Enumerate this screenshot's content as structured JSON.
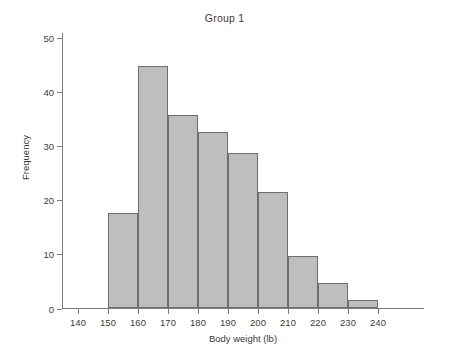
{
  "chart_data": {
    "type": "bar",
    "title": "Group 1",
    "xlabel": "Body weight (lb)",
    "ylabel": "Frequency",
    "grid": false,
    "legend": "none",
    "bin_width": 10,
    "xlim": [
      135,
      245
    ],
    "ylim": [
      0,
      50
    ],
    "x_ticks": [
      140,
      150,
      160,
      170,
      180,
      190,
      200,
      210,
      220,
      230,
      240
    ],
    "x_tick_labels": [
      "140",
      "150",
      "160",
      "170",
      "180",
      "190",
      "200",
      "210",
      "220",
      "230",
      "240"
    ],
    "y_ticks": [
      0,
      10,
      20,
      30,
      40,
      50
    ],
    "y_tick_labels": [
      "0",
      "10",
      "20",
      "30",
      "40",
      "50"
    ],
    "bin_edges": [
      150,
      160,
      170,
      180,
      190,
      200,
      210,
      220,
      230,
      240
    ],
    "categories": [
      "150-160",
      "160-170",
      "170-180",
      "180-190",
      "190-200",
      "200-210",
      "210-220",
      "220-230",
      "230-240"
    ],
    "values": [
      17.6,
      44.8,
      35.8,
      32.6,
      28.8,
      21.5,
      9.7,
      4.8,
      1.5
    ],
    "bar_fill_color": "#bebebe",
    "bar_border_color": "#6e6e6e",
    "axis_color": "#7d7d7d",
    "text_color": "#3b3b3b",
    "background_color": "#ffffff"
  }
}
